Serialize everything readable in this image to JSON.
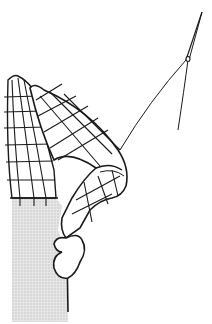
{
  "illustration": {
    "subject": "grid-patterned arm raised toward a needle and thread",
    "colors": {
      "background": "#ffffff",
      "ink": "#1a1a1a",
      "shading": "#d9d9d9"
    }
  }
}
